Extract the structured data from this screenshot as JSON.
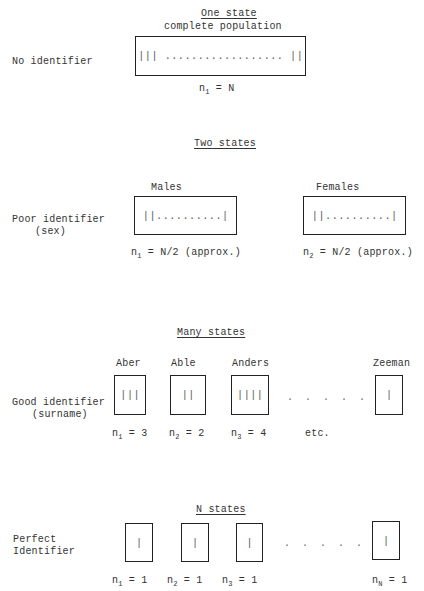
{
  "rows": [
    {
      "heading": "One state",
      "subheading": "complete population",
      "identifier_label": [
        "No identifier"
      ],
      "boxes": [
        {
          "label": "",
          "content": "||| .................. ||",
          "n_var": "n",
          "n_sub": "1",
          "n_value": "= N"
        }
      ]
    },
    {
      "heading": "Two states",
      "identifier_label": [
        "Poor identifier",
        "(sex)"
      ],
      "boxes": [
        {
          "label": "Males",
          "content": "||..........|",
          "n_var": "n",
          "n_sub": "1",
          "n_value": "= N/2 (approx.)"
        },
        {
          "label": "Females",
          "content": "||..........|",
          "n_var": "n",
          "n_sub": "2",
          "n_value": "= N/2 (approx.)"
        }
      ]
    },
    {
      "heading": "Many states",
      "identifier_label": [
        "Good identifier",
        "(surname)"
      ],
      "boxes": [
        {
          "label": "Aber",
          "content": "|||",
          "n_var": "n",
          "n_sub": "1",
          "n_value": "= 3"
        },
        {
          "label": "Able",
          "content": "||",
          "n_var": "n",
          "n_sub": "2",
          "n_value": "= 2"
        },
        {
          "label": "Anders",
          "content": "||||",
          "n_var": "n",
          "n_sub": "3",
          "n_value": "= 4"
        },
        {
          "label": "Zeeman",
          "content": "|",
          "n_var": "",
          "n_sub": "",
          "n_value": ""
        }
      ],
      "ellipsis": ". . . . . .",
      "etc_label": "etc."
    },
    {
      "heading": "N states",
      "identifier_label": [
        "Perfect",
        "Identifier"
      ],
      "boxes": [
        {
          "label": "",
          "content": "|",
          "n_var": "n",
          "n_sub": "1",
          "n_value": "= 1"
        },
        {
          "label": "",
          "content": "|",
          "n_var": "n",
          "n_sub": "2",
          "n_value": "= 1"
        },
        {
          "label": "",
          "content": "|",
          "n_var": "n",
          "n_sub": "3",
          "n_value": "= 1"
        },
        {
          "label": "",
          "content": "|",
          "n_var": "n",
          "n_sub": "N",
          "n_value": "= 1"
        }
      ],
      "ellipsis": ". . . . . . ."
    }
  ]
}
